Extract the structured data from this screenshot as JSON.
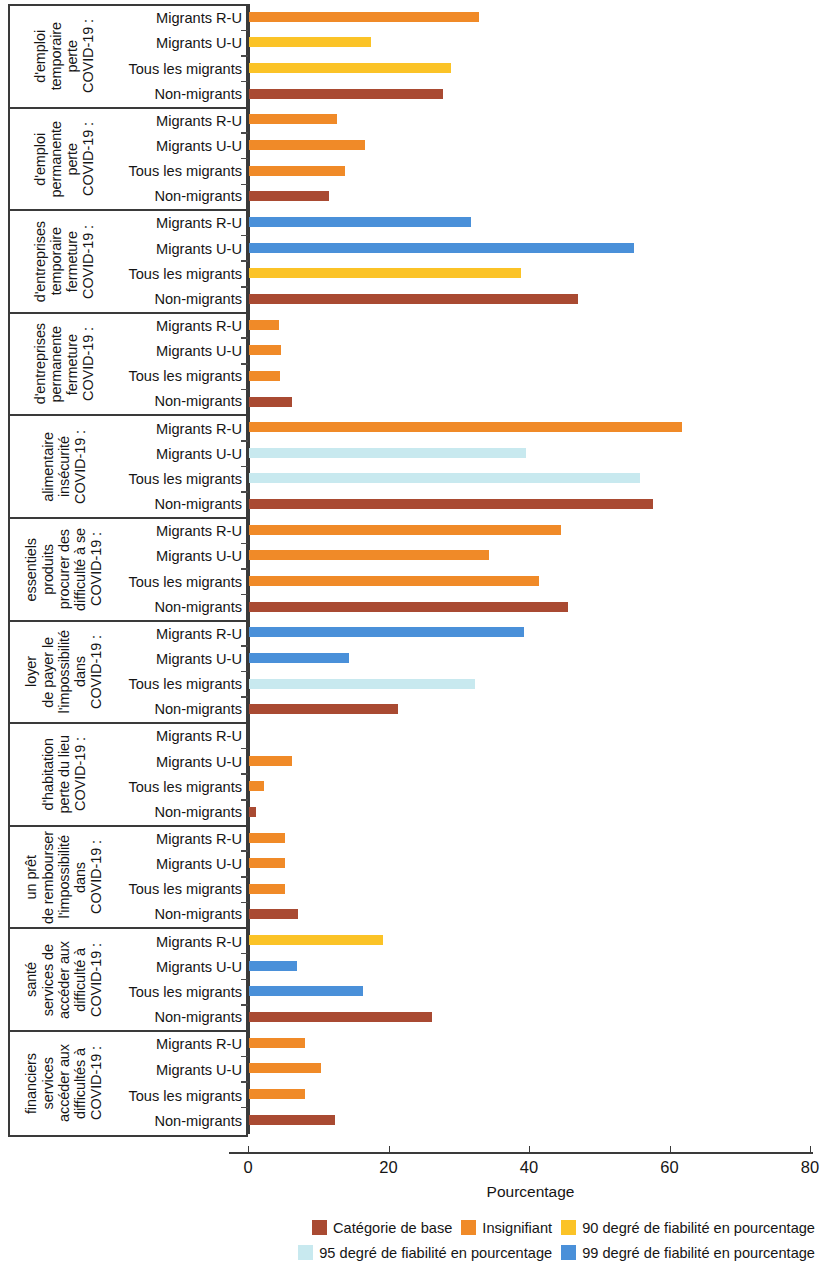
{
  "chart_data": {
    "type": "bar",
    "orientation": "horizontal",
    "title": "",
    "xlabel": "Pourcentage",
    "ylabel": "",
    "xlim": [
      0,
      80
    ],
    "xticks": [
      0,
      20,
      40,
      60,
      80
    ],
    "grid": false,
    "legend_position": "bottom-right",
    "categories": [
      "Migrants R-U",
      "Migrants U-U",
      "Tous les migrants",
      "Non-migrants"
    ],
    "colors": {
      "base": "#a94a32",
      "insignifiant": "#f08a28",
      "ci90": "#fbc327",
      "ci95": "#c8e9ef",
      "ci99": "#4a90d9"
    },
    "legend": [
      {
        "label": "Catégorie de base",
        "key": "base"
      },
      {
        "label": "Insignifiant",
        "key": "insignifiant"
      },
      {
        "label": "90 degré de fiabilité en pourcentage",
        "key": "ci90"
      },
      {
        "label": "95 degré de fiabilité en pourcentage",
        "key": "ci95"
      },
      {
        "label": "99 degré de fiabilité en pourcentage",
        "key": "ci99"
      }
    ],
    "groups": [
      {
        "title_lines": [
          "COVID-19 :",
          "perte",
          "temporaire",
          "d'emploi"
        ],
        "bars": [
          {
            "category": "Migrants R-U",
            "value": 32.7,
            "key": "insignifiant"
          },
          {
            "category": "Migrants U-U",
            "value": 17.4,
            "key": "ci90"
          },
          {
            "category": "Tous les migrants",
            "value": 28.7,
            "key": "ci90"
          },
          {
            "category": "Non-migrants",
            "value": 27.6,
            "key": "base"
          }
        ]
      },
      {
        "title_lines": [
          "COVID-19 :",
          "perte",
          "permanente",
          "d'emploi"
        ],
        "bars": [
          {
            "category": "Migrants R-U",
            "value": 12.5,
            "key": "insignifiant"
          },
          {
            "category": "Migrants U-U",
            "value": 16.5,
            "key": "insignifiant"
          },
          {
            "category": "Tous les migrants",
            "value": 13.6,
            "key": "insignifiant"
          },
          {
            "category": "Non-migrants",
            "value": 11.4,
            "key": "base"
          }
        ]
      },
      {
        "title_lines": [
          "COVID-19 :",
          "fermeture",
          "temporaire",
          "d'entreprises"
        ],
        "bars": [
          {
            "category": "Migrants R-U",
            "value": 31.6,
            "key": "ci99"
          },
          {
            "category": "Migrants U-U",
            "value": 54.8,
            "key": "ci99"
          },
          {
            "category": "Tous les migrants",
            "value": 38.7,
            "key": "ci90"
          },
          {
            "category": "Non-migrants",
            "value": 46.9,
            "key": "base"
          }
        ]
      },
      {
        "title_lines": [
          "COVID-19 :",
          "fermeture",
          "permanente",
          "d'entreprises"
        ],
        "bars": [
          {
            "category": "Migrants R-U",
            "value": 4.3,
            "key": "insignifiant"
          },
          {
            "category": "Migrants U-U",
            "value": 4.6,
            "key": "insignifiant"
          },
          {
            "category": "Tous les migrants",
            "value": 4.4,
            "key": "insignifiant"
          },
          {
            "category": "Non-migrants",
            "value": 6.1,
            "key": "base"
          }
        ]
      },
      {
        "title_lines": [
          "COVID-19 :",
          "insécurité",
          "alimentaire"
        ],
        "bars": [
          {
            "category": "Migrants R-U",
            "value": 61.6,
            "key": "insignifiant"
          },
          {
            "category": "Migrants U-U",
            "value": 39.4,
            "key": "ci95"
          },
          {
            "category": "Tous les migrants",
            "value": 55.6,
            "key": "ci95"
          },
          {
            "category": "Non-migrants",
            "value": 57.5,
            "key": "base"
          }
        ]
      },
      {
        "title_lines": [
          "COVID-19 :",
          "difficulté à se",
          "procurer des",
          "produits",
          "essentiels"
        ],
        "bars": [
          {
            "category": "Migrants R-U",
            "value": 44.4,
            "key": "insignifiant"
          },
          {
            "category": "Migrants U-U",
            "value": 34.2,
            "key": "insignifiant"
          },
          {
            "category": "Tous les migrants",
            "value": 41.3,
            "key": "insignifiant"
          },
          {
            "category": "Non-migrants",
            "value": 45.4,
            "key": "base"
          }
        ]
      },
      {
        "title_lines": [
          "COVID-19 :",
          "dans",
          "l'impossibilité",
          "de payer le",
          "loyer"
        ],
        "bars": [
          {
            "category": "Migrants R-U",
            "value": 39.1,
            "key": "ci99"
          },
          {
            "category": "Migrants U-U",
            "value": 14.3,
            "key": "ci99"
          },
          {
            "category": "Tous les migrants",
            "value": 32.2,
            "key": "ci95"
          },
          {
            "category": "Non-migrants",
            "value": 21.2,
            "key": "base"
          }
        ]
      },
      {
        "title_lines": [
          "COVID-19 :",
          "perte du lieu",
          "d'habitation"
        ],
        "bars": [
          {
            "category": "Migrants R-U",
            "value": 0.0,
            "key": "insignifiant"
          },
          {
            "category": "Migrants U-U",
            "value": 6.1,
            "key": "insignifiant"
          },
          {
            "category": "Tous les migrants",
            "value": 2.1,
            "key": "insignifiant"
          },
          {
            "category": "Non-migrants",
            "value": 1.0,
            "key": "base"
          }
        ]
      },
      {
        "title_lines": [
          "COVID-19 :",
          "dans",
          "l'impossibilité",
          "de rembourser",
          "un prêt"
        ],
        "bars": [
          {
            "category": "Migrants R-U",
            "value": 5.1,
            "key": "insignifiant"
          },
          {
            "category": "Migrants U-U",
            "value": 5.1,
            "key": "insignifiant"
          },
          {
            "category": "Tous les migrants",
            "value": 5.1,
            "key": "insignifiant"
          },
          {
            "category": "Non-migrants",
            "value": 7.0,
            "key": "base"
          }
        ]
      },
      {
        "title_lines": [
          "COVID-19 :",
          "difficulté à",
          "accéder aux",
          "services de",
          "santé"
        ],
        "bars": [
          {
            "category": "Migrants R-U",
            "value": 19.1,
            "key": "ci90"
          },
          {
            "category": "Migrants U-U",
            "value": 6.9,
            "key": "ci99"
          },
          {
            "category": "Tous les migrants",
            "value": 16.2,
            "key": "ci99"
          },
          {
            "category": "Non-migrants",
            "value": 26.1,
            "key": "base"
          }
        ]
      },
      {
        "title_lines": [
          "COVID-19 :",
          "difficultés à",
          "accéder aux",
          "services",
          "financiers"
        ],
        "bars": [
          {
            "category": "Migrants R-U",
            "value": 8.0,
            "key": "insignifiant"
          },
          {
            "category": "Migrants U-U",
            "value": 10.2,
            "key": "insignifiant"
          },
          {
            "category": "Tous les migrants",
            "value": 8.0,
            "key": "insignifiant"
          },
          {
            "category": "Non-migrants",
            "value": 12.2,
            "key": "base"
          }
        ]
      }
    ]
  }
}
